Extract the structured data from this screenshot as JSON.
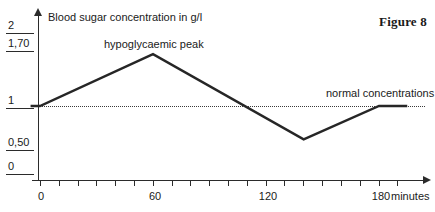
{
  "figure": {
    "caption": "Figure 8"
  },
  "chart_data": {
    "type": "line",
    "title": "Blood sugar concentration in g/l",
    "xlabel": "minutes",
    "ylabel": "Blood sugar concentration in g/l",
    "xlim": [
      -10,
      200
    ],
    "ylim": [
      0,
      2
    ],
    "grid": false,
    "legend": "none",
    "x_ticks_major": [
      0,
      60,
      120,
      180
    ],
    "x_tick_labels": [
      "0",
      "60",
      "120",
      "180"
    ],
    "x_tick_interval_minor": 10,
    "y_ticks": [
      0,
      0.5,
      1,
      1.7,
      2
    ],
    "y_tick_labels": [
      "0",
      "0,50",
      "1",
      "1,70",
      "2"
    ],
    "series": [
      {
        "name": "blood sugar concentration",
        "x": [
          -5,
          0,
          60,
          140,
          180,
          195
        ],
        "values": [
          1.0,
          1.0,
          1.7,
          0.55,
          1.0,
          1.0
        ]
      }
    ],
    "reference_lines": [
      {
        "name": "normal concentrations",
        "y": 1.0,
        "style": "dotted",
        "label": "normal concentrations"
      }
    ],
    "annotations": [
      {
        "name": "hypoglycaemic-peak",
        "text": "hypoglycaemic peak",
        "x": 60,
        "y": 1.7
      },
      {
        "name": "normal-concentrations",
        "text": "normal concentrations",
        "x": 170,
        "y": 1.0
      }
    ]
  },
  "axes": {
    "y_labels": [
      {
        "text": "2",
        "top": 20
      },
      {
        "text": "1,70",
        "top": 38
      },
      {
        "text": "1",
        "top": 95
      },
      {
        "text": "0,50",
        "top": 137
      },
      {
        "text": "0",
        "top": 161
      }
    ],
    "x_labels": [
      {
        "text": "0",
        "left": 40
      },
      {
        "text": "60",
        "left": 153
      },
      {
        "text": "120",
        "left": 266
      },
      {
        "text": "180",
        "left": 379
      }
    ],
    "x_unit": "minutes"
  },
  "colors": {
    "ink": "#1a1a1a",
    "axis": "#2b2b2b",
    "curve": "#262626",
    "background": "#ffffff"
  }
}
